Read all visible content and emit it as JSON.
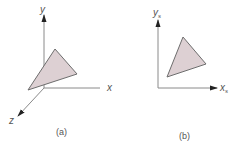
{
  "panels": [
    {
      "id": "a",
      "caption": "(a)",
      "axes": {
        "x": "x",
        "y": "y",
        "z": "z"
      },
      "description": "3D world coordinate axes with shaded triangle"
    },
    {
      "id": "b",
      "caption": "(b)",
      "axes": {
        "x": "x",
        "x_sub": "s",
        "y": "y",
        "y_sub": "s"
      },
      "description": "2D screen coordinate axes with projected shaded triangle"
    }
  ],
  "colors": {
    "triangle_fill": "#ddd0d3",
    "triangle_stroke": "#6d6d6d",
    "axis": "#8a8a8a",
    "arrowhead": "#222222",
    "text": "#555555"
  }
}
